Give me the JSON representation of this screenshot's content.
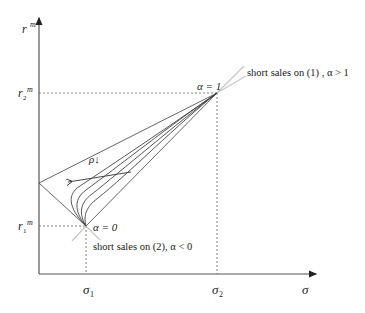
{
  "diagram": {
    "type": "mean-standard-deviation frontier for two-asset portfolios",
    "axes": {
      "y_label": "r",
      "y_label_sup": "m",
      "x_label": "σ"
    },
    "y_ticks": [
      {
        "base": "r",
        "sub": "2",
        "sup": "m"
      },
      {
        "base": "r",
        "sub": "1",
        "sup": "m"
      }
    ],
    "x_ticks": [
      {
        "base": "σ",
        "sub": "1"
      },
      {
        "base": "σ",
        "sub": "2"
      }
    ],
    "points": {
      "alpha1": "α = 1",
      "alpha0": "α = 0"
    },
    "annotations": {
      "short_sales_1": "short sales on (1) , α > 1",
      "short_sales_2": "short sales on (2), α < 0",
      "rho_label": "ρ↓"
    },
    "colors": {
      "line": "#444444",
      "extension": "#c8c8c8",
      "dashed": "#555555"
    }
  }
}
